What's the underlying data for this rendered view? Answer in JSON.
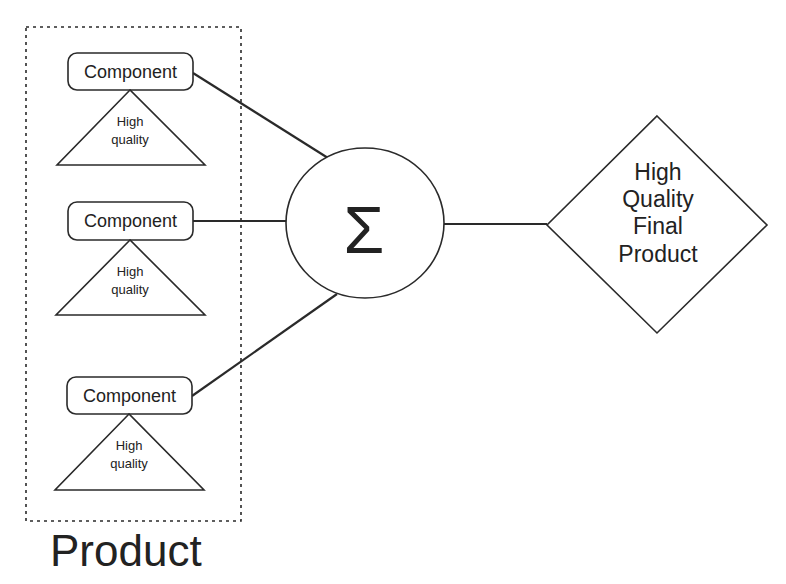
{
  "diagram": {
    "group": {
      "label": "Product",
      "border_style": "dotted"
    },
    "components": [
      {
        "label": "Component",
        "quality_lines": [
          "High",
          "quality"
        ]
      },
      {
        "label": "Component",
        "quality_lines": [
          "High",
          "quality"
        ]
      },
      {
        "label": "Component",
        "quality_lines": [
          "High",
          "quality"
        ]
      }
    ],
    "aggregator": {
      "symbol": "Σ",
      "icon": "summation-icon"
    },
    "result": {
      "lines": [
        "High",
        "Quality",
        "Final",
        "Product"
      ]
    },
    "colors": {
      "stroke": "#2a2a2a",
      "text": "#222222",
      "background": "#ffffff"
    }
  }
}
